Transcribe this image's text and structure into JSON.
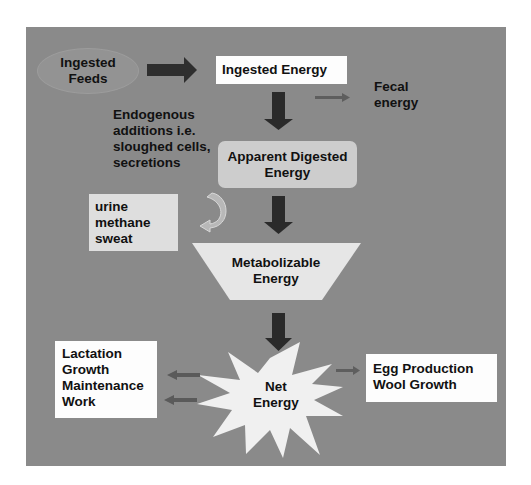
{
  "diagram": {
    "nodes": {
      "ingested_feeds": {
        "line1": "Ingested",
        "line2": "Feeds"
      },
      "ingested_energy": {
        "label": "Ingested Energy"
      },
      "fecal_energy": {
        "line1": "Fecal",
        "line2": "energy"
      },
      "endogenous": {
        "line1": "Endogenous",
        "line2": "additions i.e.",
        "line3": "sloughed cells,",
        "line4": "secretions"
      },
      "apparent_digested": {
        "line1": "Apparent Digested",
        "line2": "Energy"
      },
      "losses": {
        "line1": "urine",
        "line2": "methane",
        "line3": "sweat"
      },
      "metabolizable": {
        "line1": "Metabolizable",
        "line2": "Energy"
      },
      "net_energy": {
        "line1": "Net",
        "line2": "Energy"
      },
      "uses_left": {
        "line1": "Lactation",
        "line2": "Growth",
        "line3": "Maintenance",
        "line4": "Work"
      },
      "uses_right": {
        "line1": "Egg Production",
        "line2": "Wool Growth"
      }
    },
    "colors": {
      "background": "#8a8a8a",
      "arrow_dark": "#2a2a2a",
      "arrow_small": "#5e5e5e",
      "box_white": "#fdfdfd",
      "box_light": "#cdcdcd",
      "shape_light": "#e6e6e6"
    }
  }
}
